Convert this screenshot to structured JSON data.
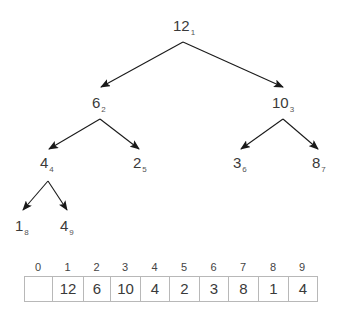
{
  "tree": {
    "nodes": [
      {
        "value": "12",
        "index": "1"
      },
      {
        "value": "6",
        "index": "2"
      },
      {
        "value": "10",
        "index": "3"
      },
      {
        "value": "4",
        "index": "4"
      },
      {
        "value": "2",
        "index": "5"
      },
      {
        "value": "3",
        "index": "6"
      },
      {
        "value": "8",
        "index": "7"
      },
      {
        "value": "1",
        "index": "8"
      },
      {
        "value": "4",
        "index": "9"
      }
    ],
    "edges": [
      {
        "from": "1",
        "to": "2"
      },
      {
        "from": "1",
        "to": "3"
      },
      {
        "from": "2",
        "to": "4"
      },
      {
        "from": "2",
        "to": "5"
      },
      {
        "from": "3",
        "to": "6"
      },
      {
        "from": "3",
        "to": "7"
      },
      {
        "from": "4",
        "to": "8"
      },
      {
        "from": "4",
        "to": "9"
      }
    ]
  },
  "array": {
    "indices": [
      "0",
      "1",
      "2",
      "3",
      "4",
      "5",
      "6",
      "7",
      "8",
      "9"
    ],
    "values": [
      "",
      "12",
      "6",
      "10",
      "4",
      "2",
      "3",
      "8",
      "1",
      "4"
    ]
  },
  "colors": {
    "edge": "#1a1a1a",
    "text": "#3a3a3a",
    "cell_border": "#b8b8b8"
  }
}
